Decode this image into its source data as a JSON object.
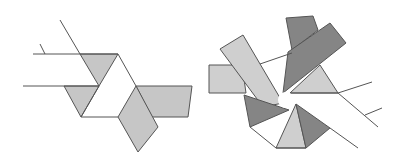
{
  "diagram": {
    "title": "Twist fold diagrams",
    "colors": {
      "background": "#ffffff",
      "stroke": "#555555",
      "light_fill": "#cfcfcf",
      "mid_fill": "#c6c6c6",
      "dark_fill": "#858585",
      "white_fill": "#ffffff"
    },
    "figures": [
      {
        "name": "triangle-twist",
        "description": "Three-fold twist with triangular center",
        "lines": [
          [
            [
              60,
              20
            ],
            [
              80,
              54
            ]
          ],
          [
            [
              40,
              44
            ],
            [
              45,
              54
            ]
          ],
          [
            [
              33,
              54
            ],
            [
              118,
              54
            ]
          ],
          [
            [
              23,
              86
            ],
            [
              99,
              86
            ]
          ],
          [
            [
              81,
              117
            ],
            [
              118,
              117
            ]
          ],
          [
            [
              118,
              54
            ],
            [
              136,
              86
            ]
          ],
          [
            [
              99,
              86
            ],
            [
              81,
              117
            ]
          ]
        ],
        "polygons": [
          {
            "fill": "mid",
            "points": [
              [
                80,
                54
              ],
              [
                118,
                54
              ],
              [
                99,
                86
              ]
            ]
          },
          {
            "fill": "mid",
            "points": [
              [
                64,
                86
              ],
              [
                99,
                86
              ],
              [
                81,
                117
              ]
            ]
          },
          {
            "fill": "mid",
            "points": [
              [
                136,
                86
              ],
              [
                192,
                86
              ],
              [
                188,
                117
              ],
              [
                152,
                117
              ]
            ]
          },
          {
            "fill": "mid",
            "points": [
              [
                136,
                86
              ],
              [
                158,
                127
              ],
              [
                138,
                152
              ],
              [
                118,
                117
              ]
            ]
          }
        ]
      },
      {
        "name": "pinwheel-twist",
        "description": "Multi-fold pinwheel twist with circular center",
        "center": {
          "x": 286,
          "y": 100,
          "r": 8
        },
        "lines": [
          [
            [
              260,
              64
            ],
            [
              292,
              53
            ]
          ],
          [
            [
              338,
              93
            ],
            [
              372,
              82
            ]
          ],
          [
            [
              338,
              93
            ],
            [
              378,
              127
            ]
          ],
          [
            [
              365,
              115
            ],
            [
              382,
              108
            ]
          ],
          [
            [
              330,
              128
            ],
            [
              358,
              148
            ]
          ],
          [
            [
              250,
              127
            ],
            [
              276,
              148
            ]
          ],
          [
            [
              276,
              148
            ],
            [
              306,
              148
            ]
          ],
          [
            [
              290,
              93
            ],
            [
              338,
              93
            ]
          ]
        ],
        "polygons": [
          {
            "fill": "light",
            "points": [
              [
                209,
                65
              ],
              [
                242,
                65
              ],
              [
                246,
                93
              ],
              [
                209,
                93
              ]
            ]
          },
          {
            "fill": "light",
            "points": [
              [
                220,
                49
              ],
              [
                243,
                35
              ],
              [
                283,
                103
              ],
              [
                263,
                107
              ]
            ]
          },
          {
            "fill": "dark",
            "points": [
              [
                286,
                18
              ],
              [
                313,
                16
              ],
              [
                318,
                30
              ],
              [
                292,
                50
              ]
            ]
          },
          {
            "fill": "dark",
            "points": [
              [
                288,
                52
              ],
              [
                330,
                23
              ],
              [
                346,
                43
              ],
              [
                283,
                93
              ]
            ]
          },
          {
            "fill": "light",
            "points": [
              [
                320,
                65
              ],
              [
                338,
                93
              ],
              [
                290,
                93
              ]
            ]
          },
          {
            "fill": "dark",
            "points": [
              [
                244,
                95
              ],
              [
                289,
                110
              ],
              [
                250,
                127
              ]
            ]
          },
          {
            "fill": "light",
            "points": [
              [
                276,
                148
              ],
              [
                296,
                104
              ],
              [
                306,
                148
              ]
            ]
          },
          {
            "fill": "dark",
            "points": [
              [
                296,
                104
              ],
              [
                330,
                128
              ],
              [
                306,
                148
              ]
            ]
          }
        ]
      }
    ]
  }
}
